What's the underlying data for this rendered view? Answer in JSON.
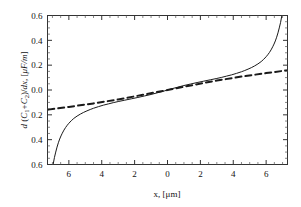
{
  "chart_data": {
    "type": "line",
    "title": "",
    "subtitle": "",
    "xlabel": "x, [μm]",
    "ylabel": "d (C₁+C₂)/dx, [μF/m]",
    "xlim": [
      -7.3,
      7.3
    ],
    "ylim": [
      -0.6,
      0.6
    ],
    "xticks": [
      -6,
      -4,
      -2,
      0,
      2,
      4,
      6
    ],
    "xticklabels": [
      "6",
      "4",
      "2",
      "0",
      "2",
      "4",
      "6"
    ],
    "yticks": [
      -0.6,
      -0.4,
      -0.2,
      0.0,
      0.2,
      0.4,
      0.6
    ],
    "yticklabels": [
      "0.6",
      "0.4",
      "0.2",
      "0.0",
      "0.2",
      "0.4",
      "0.6"
    ],
    "grid": false,
    "legend": "none",
    "minor_ticks": true,
    "frame": "box",
    "series": [
      {
        "name": "exact",
        "style": "solid",
        "color": "#1a1a1a",
        "linewidth": 1.0,
        "x": [
          -6.95,
          -6.88,
          -6.8,
          -6.72,
          -6.64,
          -6.56,
          -6.48,
          -6.4,
          -6.3,
          -6.2,
          -6.1,
          -6.0,
          -5.85,
          -5.7,
          -5.5,
          -5.3,
          -5.1,
          -4.9,
          -4.7,
          -4.5,
          -4.2,
          -3.9,
          -3.6,
          -3.3,
          -3.0,
          -2.6,
          -2.2,
          -1.8,
          -1.4,
          -1.0,
          -0.6,
          -0.2,
          0.2,
          0.6,
          1.0,
          1.4,
          1.8,
          2.2,
          2.6,
          3.0,
          3.3,
          3.6,
          3.9,
          4.2,
          4.5,
          4.7,
          4.9,
          5.1,
          5.3,
          5.5,
          5.7,
          5.85,
          6.0,
          6.1,
          6.2,
          6.3,
          6.4,
          6.48,
          6.56,
          6.64,
          6.72,
          6.8,
          6.88,
          6.95
        ],
        "y": [
          -0.595,
          -0.545,
          -0.5,
          -0.46,
          -0.425,
          -0.395,
          -0.37,
          -0.348,
          -0.323,
          -0.302,
          -0.284,
          -0.268,
          -0.247,
          -0.229,
          -0.21,
          -0.194,
          -0.18,
          -0.168,
          -0.157,
          -0.147,
          -0.134,
          -0.122,
          -0.112,
          -0.102,
          -0.093,
          -0.082,
          -0.071,
          -0.06,
          -0.048,
          -0.036,
          -0.022,
          -0.008,
          0.008,
          0.022,
          0.036,
          0.048,
          0.06,
          0.071,
          0.082,
          0.093,
          0.102,
          0.112,
          0.122,
          0.134,
          0.147,
          0.157,
          0.168,
          0.18,
          0.194,
          0.21,
          0.229,
          0.247,
          0.268,
          0.284,
          0.302,
          0.323,
          0.348,
          0.37,
          0.395,
          0.425,
          0.46,
          0.5,
          0.545,
          0.595
        ]
      },
      {
        "name": "approximation",
        "style": "dashed",
        "color": "#1a1a1a",
        "linewidth": 2.0,
        "x": [
          -7.25,
          -6.0,
          -4.5,
          -3.0,
          -1.5,
          0.0,
          1.5,
          3.0,
          4.5,
          6.0,
          7.25
        ],
        "y": [
          -0.158,
          -0.136,
          -0.108,
          -0.076,
          -0.039,
          0.0,
          0.039,
          0.076,
          0.108,
          0.136,
          0.158
        ]
      }
    ]
  },
  "figure": {
    "background": "#ffffff",
    "axis_color": "#333333",
    "text_color": "#111111"
  }
}
